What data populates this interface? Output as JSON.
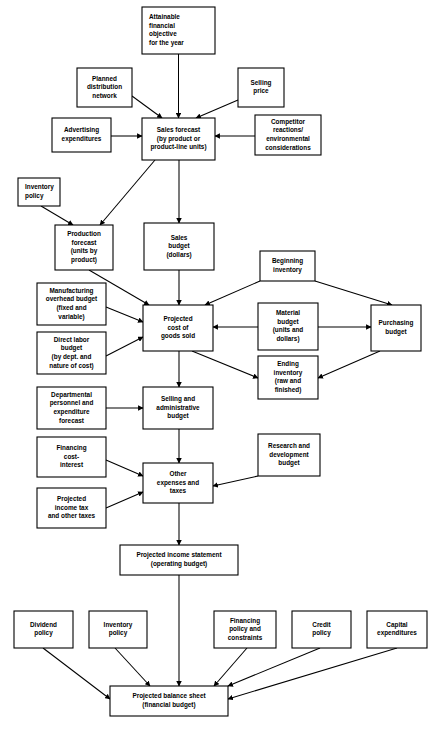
{
  "diagram": {
    "colors": {
      "line": "#000000",
      "box_fill": "#ffffff",
      "text": "#000000"
    },
    "nodes": [
      {
        "id": "attainable-financial-objective",
        "x": 142,
        "y": 7,
        "w": 73,
        "h": 47,
        "align": "left",
        "lines": [
          "Attainable",
          "financial",
          "objective",
          "for the year"
        ]
      },
      {
        "id": "planned-distribution-network",
        "x": 77,
        "y": 68,
        "w": 55,
        "h": 39,
        "align": "center",
        "lines": [
          "Planned",
          "distribution",
          "network"
        ]
      },
      {
        "id": "selling-price",
        "x": 238,
        "y": 68,
        "w": 46,
        "h": 39,
        "align": "center",
        "lines": [
          "Selling",
          "price"
        ]
      },
      {
        "id": "advertising-expenditures",
        "x": 52,
        "y": 118,
        "w": 59,
        "h": 34,
        "align": "center",
        "lines": [
          "Advertising",
          "expenditures"
        ]
      },
      {
        "id": "sales-forecast",
        "x": 142,
        "y": 118,
        "w": 73,
        "h": 42,
        "align": "center",
        "lines": [
          "Sales forecast",
          "(by product or",
          "product-line units)"
        ]
      },
      {
        "id": "competitor-reactions",
        "x": 255,
        "y": 115,
        "w": 66,
        "h": 40,
        "align": "center",
        "lines": [
          "Competitor",
          "reactions/",
          "environmental",
          "considerations"
        ]
      },
      {
        "id": "inventory-policy-top",
        "x": 18,
        "y": 178,
        "w": 42,
        "h": 28,
        "align": "left",
        "lines": [
          "Inventory",
          "policy"
        ]
      },
      {
        "id": "production-forecast",
        "x": 55,
        "y": 225,
        "w": 58,
        "h": 45,
        "align": "center",
        "lines": [
          "Production",
          "forecast",
          "(units by",
          "product)"
        ]
      },
      {
        "id": "sales-budget",
        "x": 144,
        "y": 223,
        "w": 70,
        "h": 47,
        "align": "center",
        "lines": [
          "Sales",
          "budget",
          "(dollars)"
        ]
      },
      {
        "id": "beginning-inventory",
        "x": 260,
        "y": 251,
        "w": 55,
        "h": 30,
        "align": "center",
        "lines": [
          "Beginning",
          "inventory"
        ]
      },
      {
        "id": "manufacturing-overhead-budget",
        "x": 37,
        "y": 283,
        "w": 69,
        "h": 42,
        "align": "center",
        "lines": [
          "Manufacturing",
          "overhead budget",
          "(fixed and",
          "variable)"
        ]
      },
      {
        "id": "projected-cost-of-goods-sold",
        "x": 143,
        "y": 305,
        "w": 70,
        "h": 46,
        "align": "center",
        "lines": [
          "Projected",
          "cost of",
          "goods sold"
        ]
      },
      {
        "id": "material-budget",
        "x": 258,
        "y": 303,
        "w": 60,
        "h": 47,
        "align": "center",
        "lines": [
          "Material",
          "budget",
          "(units and",
          "dollars)"
        ]
      },
      {
        "id": "purchasing-budget",
        "x": 371,
        "y": 305,
        "w": 50,
        "h": 46,
        "align": "center",
        "lines": [
          "Purchasing",
          "budget"
        ]
      },
      {
        "id": "direct-labor-budget",
        "x": 37,
        "y": 332,
        "w": 69,
        "h": 42,
        "align": "center",
        "lines": [
          "Direct labor",
          "budget",
          "(by dept. and",
          "nature of cost)"
        ]
      },
      {
        "id": "ending-inventory",
        "x": 258,
        "y": 356,
        "w": 60,
        "h": 43,
        "align": "center",
        "lines": [
          "Ending",
          "inventory",
          "(raw and",
          "finished)"
        ]
      },
      {
        "id": "departmental-personnel-forecast",
        "x": 37,
        "y": 387,
        "w": 69,
        "h": 42,
        "align": "center",
        "lines": [
          "Departmental",
          "personnel and",
          "expenditure",
          "forecast"
        ]
      },
      {
        "id": "selling-administrative-budget",
        "x": 143,
        "y": 387,
        "w": 70,
        "h": 42,
        "align": "center",
        "lines": [
          "Selling and",
          "administrative",
          "budget"
        ]
      },
      {
        "id": "financing-cost-interest",
        "x": 37,
        "y": 437,
        "w": 69,
        "h": 40,
        "align": "center",
        "lines": [
          "Financing",
          "cost-",
          "interest"
        ]
      },
      {
        "id": "other-expenses-and-taxes",
        "x": 143,
        "y": 463,
        "w": 70,
        "h": 40,
        "align": "center",
        "lines": [
          "Other",
          "expenses and",
          "taxes"
        ]
      },
      {
        "id": "research-development-budget",
        "x": 258,
        "y": 434,
        "w": 62,
        "h": 42,
        "align": "center",
        "lines": [
          "Research and",
          "development",
          "budget"
        ]
      },
      {
        "id": "projected-income-tax",
        "x": 37,
        "y": 488,
        "w": 69,
        "h": 40,
        "align": "center",
        "lines": [
          "Projected",
          "income tax",
          "and other taxes"
        ]
      },
      {
        "id": "projected-income-statement",
        "x": 120,
        "y": 545,
        "w": 118,
        "h": 30,
        "align": "center",
        "lines": [
          "Projected income statement",
          "(operating budget)"
        ]
      },
      {
        "id": "dividend-policy",
        "x": 14,
        "y": 611,
        "w": 59,
        "h": 37,
        "align": "center",
        "lines": [
          "Dividend",
          "policy"
        ]
      },
      {
        "id": "inventory-policy-bottom",
        "x": 89,
        "y": 611,
        "w": 58,
        "h": 37,
        "align": "center",
        "lines": [
          "Inventory",
          "policy"
        ]
      },
      {
        "id": "financing-policy-constraints",
        "x": 214,
        "y": 611,
        "w": 62,
        "h": 37,
        "align": "center",
        "lines": [
          "Financing",
          "policy and",
          "constraints"
        ]
      },
      {
        "id": "credit-policy",
        "x": 292,
        "y": 611,
        "w": 59,
        "h": 37,
        "align": "center",
        "lines": [
          "Credit",
          "policy"
        ]
      },
      {
        "id": "capital-expenditures",
        "x": 367,
        "y": 611,
        "w": 60,
        "h": 37,
        "align": "center",
        "lines": [
          "Capital",
          "expenditures"
        ]
      },
      {
        "id": "projected-balance-sheet",
        "x": 110,
        "y": 686,
        "w": 118,
        "h": 30,
        "align": "center",
        "lines": [
          "Projected balance sheet",
          "(financial budget)"
        ]
      }
    ],
    "edges": [
      {
        "id": "attainable-to-sales-forecast",
        "from": "attainable-financial-objective",
        "to": "sales-forecast",
        "path": "M 178.5 54 L 178.5 118"
      },
      {
        "id": "planned-distribution-to-sales-forecast",
        "from": "planned-distribution-network",
        "to": "sales-forecast",
        "path": "M 132 96 L 162 118"
      },
      {
        "id": "selling-price-to-sales-forecast",
        "from": "selling-price",
        "to": "sales-forecast",
        "path": "M 238 100 L 196 118"
      },
      {
        "id": "advertising-to-sales-forecast",
        "from": "advertising-expenditures",
        "to": "sales-forecast",
        "path": "M 111 136 L 142 136"
      },
      {
        "id": "competitor-to-sales-forecast",
        "from": "competitor-reactions",
        "to": "sales-forecast",
        "path": "M 255 136 L 215 136"
      },
      {
        "id": "sales-forecast-to-production-forecast",
        "from": "sales-forecast",
        "to": "production-forecast",
        "path": "M 155 160 L 100 225"
      },
      {
        "id": "sales-forecast-to-sales-budget",
        "from": "sales-forecast",
        "to": "sales-budget",
        "path": "M 179 160 L 179 223"
      },
      {
        "id": "inventory-policy-to-production-forecast",
        "from": "inventory-policy-top",
        "to": "production-forecast",
        "path": "M 41 206 L 73 225"
      },
      {
        "id": "production-forecast-to-cost-of-goods",
        "from": "production-forecast",
        "to": "projected-cost-of-goods-sold",
        "path": "M 89 270 L 149 305"
      },
      {
        "id": "sales-budget-to-cost-of-goods",
        "from": "sales-budget",
        "to": "projected-cost-of-goods-sold",
        "path": "M 179 270 L 179 305"
      },
      {
        "id": "beginning-inventory-to-cost-of-goods",
        "from": "beginning-inventory",
        "to": "projected-cost-of-goods-sold",
        "path": "M 260 281 L 205 305"
      },
      {
        "id": "beginning-inventory-to-purchasing",
        "from": "beginning-inventory",
        "to": "purchasing-budget",
        "path": "M 315 281 L 392 305"
      },
      {
        "id": "manufacturing-overhead-to-cost-of-goods",
        "from": "manufacturing-overhead-budget",
        "to": "projected-cost-of-goods-sold",
        "path": "M 106 307 L 143 322"
      },
      {
        "id": "direct-labor-to-cost-of-goods",
        "from": "direct-labor-budget",
        "to": "projected-cost-of-goods-sold",
        "path": "M 106 356 L 143 337"
      },
      {
        "id": "material-budget-to-cost-of-goods",
        "from": "material-budget",
        "to": "projected-cost-of-goods-sold",
        "path": "M 258 327 L 213 327"
      },
      {
        "id": "material-budget-to-purchasing",
        "from": "material-budget",
        "to": "purchasing-budget",
        "path": "M 318 327 L 371 327"
      },
      {
        "id": "purchasing-to-ending-inventory",
        "from": "purchasing-budget",
        "to": "ending-inventory",
        "path": "M 380 351 L 318 378"
      },
      {
        "id": "cost-of-goods-to-ending-inventory",
        "from": "projected-cost-of-goods-sold",
        "to": "ending-inventory",
        "path": "M 192 351 L 258 378"
      },
      {
        "id": "cost-of-goods-to-selling-admin",
        "from": "projected-cost-of-goods-sold",
        "to": "selling-administrative-budget",
        "path": "M 179 351 L 179 387"
      },
      {
        "id": "departmental-to-selling-admin",
        "from": "departmental-personnel-forecast",
        "to": "selling-administrative-budget",
        "path": "M 106 408 L 143 408"
      },
      {
        "id": "selling-admin-to-other-expenses",
        "from": "selling-administrative-budget",
        "to": "other-expenses-and-taxes",
        "path": "M 179 429 L 179 463"
      },
      {
        "id": "financing-cost-to-other-expenses",
        "from": "financing-cost-interest",
        "to": "other-expenses-and-taxes",
        "path": "M 106 460 L 143 476"
      },
      {
        "id": "research-dev-to-other-expenses",
        "from": "research-development-budget",
        "to": "other-expenses-and-taxes",
        "path": "M 258 476 L 213 486"
      },
      {
        "id": "projected-income-tax-to-other-expenses",
        "from": "projected-income-tax",
        "to": "other-expenses-and-taxes",
        "path": "M 106 508 L 143 492"
      },
      {
        "id": "other-expenses-to-income-statement",
        "from": "other-expenses-and-taxes",
        "to": "projected-income-statement",
        "path": "M 179 503 L 179 545"
      },
      {
        "id": "income-statement-to-balance-sheet",
        "from": "projected-income-statement",
        "to": "projected-balance-sheet",
        "path": "M 179 575 L 179 686"
      },
      {
        "id": "dividend-policy-to-balance-sheet",
        "from": "dividend-policy",
        "to": "projected-balance-sheet",
        "path": "M 43 648 L 110 699"
      },
      {
        "id": "inventory-policy-bottom-to-balance-sheet",
        "from": "inventory-policy-bottom",
        "to": "projected-balance-sheet",
        "path": "M 115 648 L 150 686"
      },
      {
        "id": "financing-policy-to-balance-sheet",
        "from": "financing-policy-constraints",
        "to": "projected-balance-sheet",
        "path": "M 247 648 L 214 686"
      },
      {
        "id": "credit-policy-to-balance-sheet",
        "from": "credit-policy",
        "to": "projected-balance-sheet",
        "path": "M 320 648 L 228 686"
      },
      {
        "id": "capital-expenditures-to-balance-sheet",
        "from": "capital-expenditures",
        "to": "projected-balance-sheet",
        "path": "M 397 648 L 228 699"
      }
    ]
  }
}
